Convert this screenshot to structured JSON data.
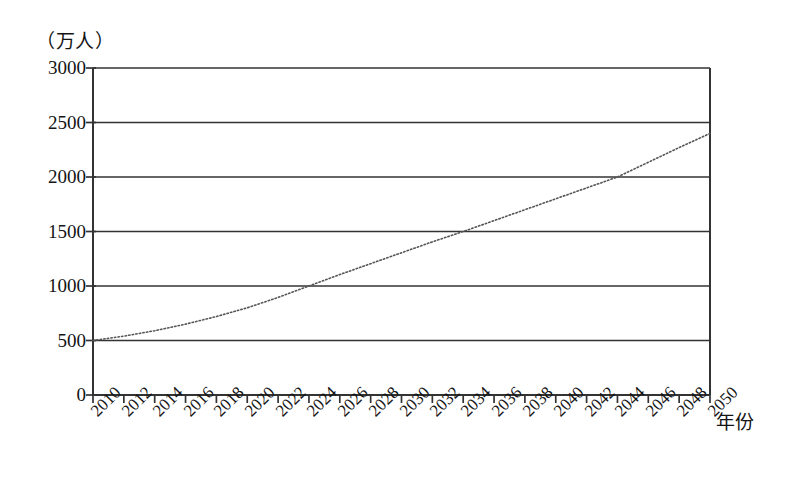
{
  "chart_data": {
    "type": "line",
    "title": "",
    "subtitle": "",
    "xlabel": "年份",
    "ylabel": "（万人）",
    "unit_note": "（万人）",
    "xlim": [
      2010,
      2050
    ],
    "ylim": [
      0,
      3000
    ],
    "grid": true,
    "legend": false,
    "legend_position": "none",
    "line_style": "dotted",
    "line_color": "#555555",
    "axis_color": "#333333",
    "x": [
      2010,
      2012,
      2014,
      2016,
      2018,
      2020,
      2022,
      2024,
      2026,
      2028,
      2030,
      2032,
      2034,
      2036,
      2038,
      2040,
      2042,
      2044,
      2046,
      2048,
      2050
    ],
    "values": [
      500,
      540,
      590,
      650,
      720,
      800,
      895,
      1000,
      1105,
      1205,
      1305,
      1405,
      1500,
      1600,
      1700,
      1800,
      1900,
      2000,
      2135,
      2270,
      2400
    ],
    "series": [
      {
        "name": "人口",
        "values": [
          500,
          540,
          590,
          650,
          720,
          800,
          895,
          1000,
          1105,
          1205,
          1305,
          1405,
          1500,
          1600,
          1700,
          1800,
          1900,
          2000,
          2135,
          2270,
          2400
        ]
      }
    ],
    "categories": [
      "2010",
      "2012",
      "2014",
      "2016",
      "2018",
      "2020",
      "2022",
      "2024",
      "2026",
      "2028",
      "2030",
      "2032",
      "2034",
      "2036",
      "2038",
      "2040",
      "2042",
      "2044",
      "2046",
      "2048",
      "2050"
    ],
    "xticks": [
      "2010",
      "2012",
      "2014",
      "2016",
      "2018",
      "2020",
      "2022",
      "2024",
      "2026",
      "2028",
      "2030",
      "2032",
      "2034",
      "2036",
      "2038",
      "2040",
      "2042",
      "2044",
      "2046",
      "2048",
      "2050"
    ],
    "yticks": [
      "0",
      "500",
      "1000",
      "1500",
      "2000",
      "2500",
      "3000"
    ],
    "ytick_values": [
      0,
      500,
      1000,
      1500,
      2000,
      2500,
      3000
    ],
    "annotations": []
  }
}
